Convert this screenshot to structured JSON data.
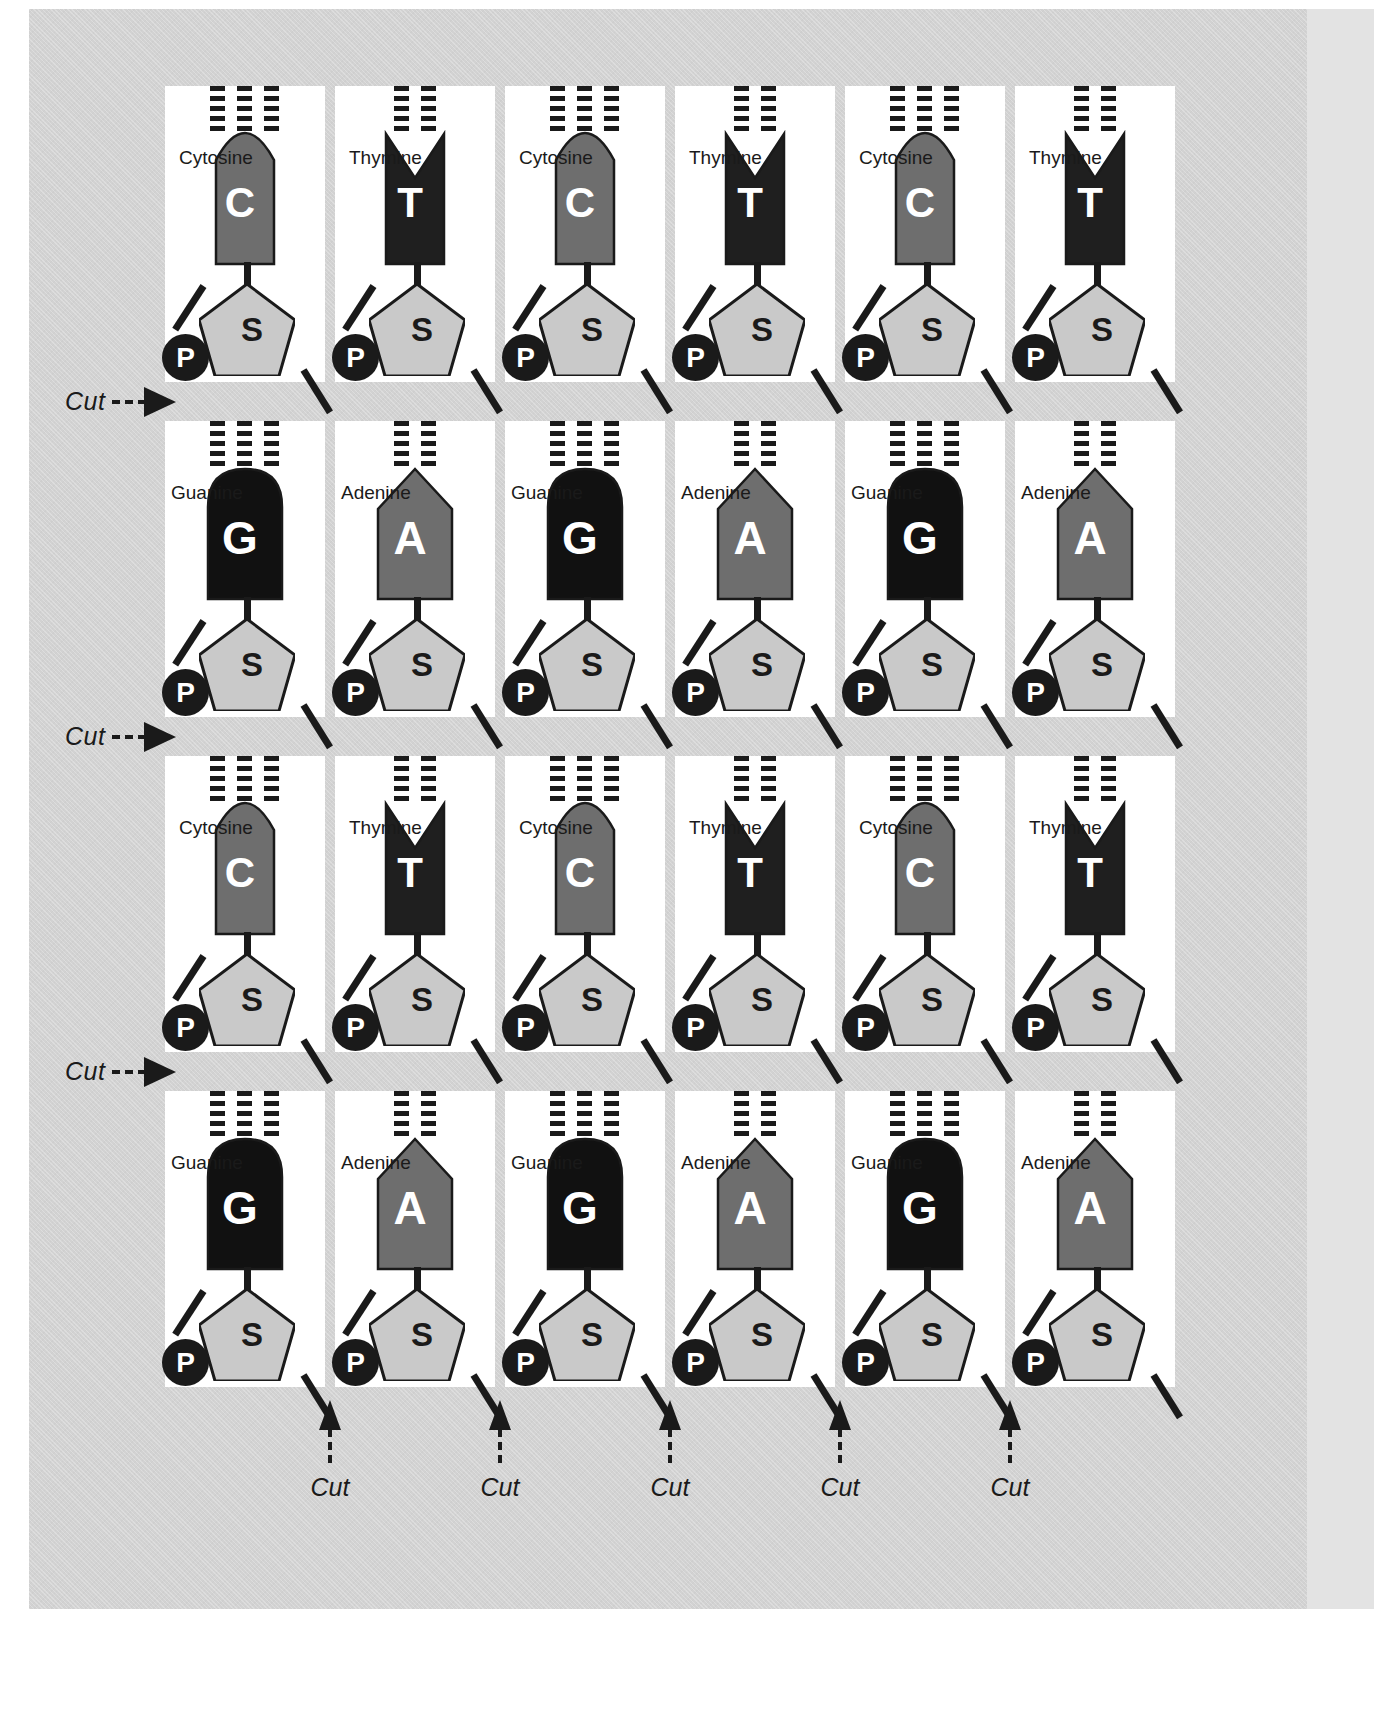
{
  "sheet": {
    "title": "DNA Nucleotide Cut-Out Sheet",
    "background_color": "#d2d2d2",
    "card_color": "#ffffff"
  },
  "bases": {
    "C": {
      "letter": "C",
      "name": "Cytosine",
      "color": "#6e6e6e",
      "top_shape": "concave",
      "hbond_count": 3,
      "width": 58
    },
    "T": {
      "letter": "T",
      "name": "Thymine",
      "color": "#1f1f1f",
      "top_shape": "notch",
      "hbond_count": 2,
      "width": 58
    },
    "G": {
      "letter": "G",
      "name": "Guanine",
      "color": "#111111",
      "top_shape": "dome",
      "hbond_count": 3,
      "width": 74
    },
    "A": {
      "letter": "A",
      "name": "Adenine",
      "color": "#6e6e6e",
      "top_shape": "peak",
      "hbond_count": 2,
      "width": 74
    }
  },
  "parts": {
    "sugar_letter": "S",
    "sugar_name": "Sugar",
    "sugar_color": "#c9c9c9",
    "phosphate_letter": "P",
    "phosphate_name": "Phosphate",
    "phosphate_color": "#1a1a1a"
  },
  "grid": {
    "columns": 6,
    "rows": 4,
    "cells": [
      [
        "C",
        "T",
        "C",
        "T",
        "C",
        "T"
      ],
      [
        "G",
        "A",
        "G",
        "A",
        "G",
        "A"
      ],
      [
        "C",
        "T",
        "C",
        "T",
        "C",
        "T"
      ],
      [
        "G",
        "A",
        "G",
        "A",
        "G",
        "A"
      ]
    ]
  },
  "cut_markers": {
    "label": "Cut",
    "left_count": 3,
    "bottom_count": 5
  },
  "cut_left": [
    {
      "label": "Cut"
    },
    {
      "label": "Cut"
    },
    {
      "label": "Cut"
    }
  ],
  "cut_bottom": [
    {
      "label": "Cut"
    },
    {
      "label": "Cut"
    },
    {
      "label": "Cut"
    },
    {
      "label": "Cut"
    },
    {
      "label": "Cut"
    }
  ]
}
